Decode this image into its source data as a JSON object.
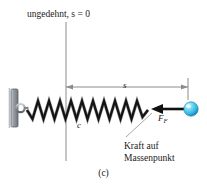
{
  "figure": {
    "caption": "(c)",
    "labels": {
      "unstretched": "ungedehnt, s = 0",
      "displacement": "s",
      "spring_constant": "c",
      "force_symbol_base": "F",
      "force_symbol_sub": "F",
      "force_caption_line1": "Kraft auf",
      "force_caption_line2": "Massenpunkt"
    },
    "colors": {
      "line": "#1a1a1a",
      "thin_line": "#8c8c8c",
      "wall_fill": "#9aa0a6",
      "wall_edge": "#5f6368",
      "ball_main": "#3fc2e8",
      "ball_highlight": "#d9f6ff",
      "ball_shadow": "#1576a3",
      "background": "#ffffff",
      "spring_dark": "#111111",
      "spring_light": "#9e9e9e"
    },
    "geometry": {
      "reference_line_x": 66,
      "reference_line_y_top": 22,
      "reference_line_y_bottom": 161,
      "dimension_line_y": 87,
      "dimension_left_x": 66,
      "dimension_right_x": 188,
      "spring_axis_y": 110,
      "spring_start_x": 27,
      "spring_end_x": 148,
      "spring_coils": 11,
      "spring_amplitude": 9,
      "ball_center_x": 191,
      "ball_center_y": 109,
      "ball_radius": 7,
      "arrow_tail_x": 183,
      "arrow_head_x": 152
    }
  }
}
